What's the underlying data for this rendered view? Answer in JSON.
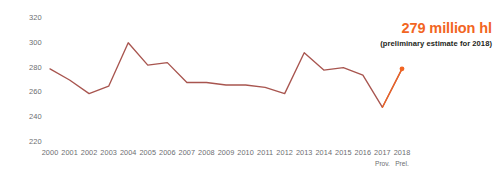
{
  "chart_data": {
    "type": "line",
    "title": "",
    "subtitle": "",
    "xlabel": "",
    "ylabel": "",
    "categories": [
      "2000",
      "2001",
      "2002",
      "2003",
      "2004",
      "2005",
      "2006",
      "2007",
      "2008",
      "2009",
      "2010",
      "2011",
      "2012",
      "2013",
      "2014",
      "2015",
      "2016",
      "2017",
      "2018"
    ],
    "category_sublabels": [
      "",
      "",
      "",
      "",
      "",
      "",
      "",
      "",
      "",
      "",
      "",
      "",
      "",
      "",
      "",
      "",
      "",
      "Prov.",
      "Prel."
    ],
    "values": [
      279,
      270,
      259,
      265,
      300,
      282,
      284,
      268,
      268,
      266,
      266,
      264,
      259,
      292,
      278,
      280,
      274,
      248,
      279
    ],
    "series": [
      {
        "name": "World wine production",
        "values": [
          279,
          270,
          259,
          265,
          300,
          282,
          284,
          268,
          268,
          266,
          266,
          264,
          259,
          292,
          278,
          280,
          274,
          248,
          279
        ],
        "color": "#a8554f"
      }
    ],
    "ylim": [
      220,
      320
    ],
    "yticks": [
      320,
      300,
      280,
      260,
      240,
      220
    ],
    "ytick_labels": [
      "320",
      "300",
      "280",
      "260",
      "240",
      "220"
    ],
    "grid": false,
    "legend": null,
    "marker_points": [
      {
        "category": "2018",
        "value": 279,
        "color": "#f26522"
      }
    ],
    "annotations": {
      "headline": "279 million hl",
      "sub": "(preliminary estimate for 2018)"
    },
    "colors": {
      "line": "#a8554f",
      "accent": "#f26522",
      "tick_text": "#6d6e71",
      "annotation_sub_text": "#231f20",
      "background": "#ffffff"
    }
  }
}
